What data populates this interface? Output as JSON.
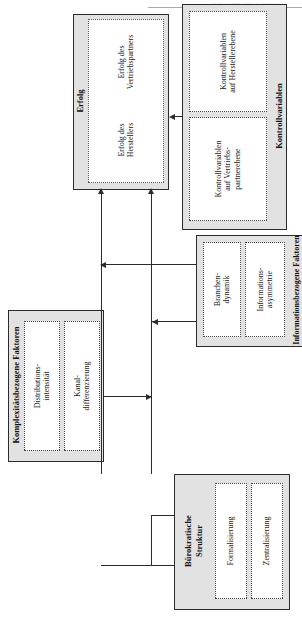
{
  "page": {
    "header_ghost_text": "—— ——— —— — ————"
  },
  "diagram": {
    "colors": {
      "group_fill": "#e2e2e2",
      "sub_fill": "#ffffff",
      "line": "#2b2b2b"
    },
    "groups": {
      "erfolg": {
        "title": "Erfolg",
        "items": [
          {
            "label": "Erfolg des\nHerstellers"
          },
          {
            "label": "Erfolg des\nVertriebspartners"
          }
        ]
      },
      "kontrollvariablen": {
        "title": "Kontrollvariablen",
        "items": [
          {
            "label": "Kontrollvariablen\nauf Vertriebs-\npartnerebene"
          },
          {
            "label": "Kontrollvariablen\nauf Herstellerebene"
          }
        ]
      },
      "komplexitaet": {
        "title": "Komplexitätsbezogene Faktoren",
        "items": [
          {
            "label": "Distributions-\nintensität"
          },
          {
            "label": "Kanal-\ndifferenzierung"
          }
        ]
      },
      "information": {
        "title": "Informationsbezogene Faktoren",
        "items": [
          {
            "label": "Branchen-\ndynamik"
          },
          {
            "label": "Informations-\nasymmetrie"
          }
        ]
      },
      "buerokratie": {
        "title": "Bürokratische\nStruktur",
        "items": [
          {
            "label": "Formalisierung"
          },
          {
            "label": "Zentralisierung"
          }
        ]
      }
    }
  }
}
